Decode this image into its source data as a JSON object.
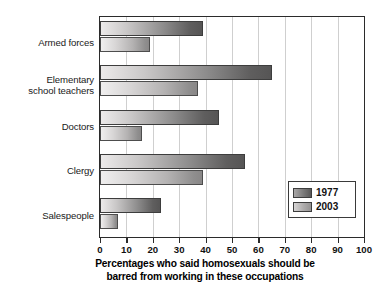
{
  "chart_data": {
    "type": "bar",
    "orientation": "horizontal",
    "title": "",
    "xlabel": "Percentages who said homosexuals should be barred from working in these occupations",
    "ylabel": "",
    "xlim": [
      0,
      100
    ],
    "xticks": [
      0,
      10,
      20,
      30,
      40,
      50,
      60,
      70,
      80,
      90,
      100
    ],
    "grid": true,
    "grid_axis": "x",
    "legend_position": "lower-right",
    "categories": [
      "Armed forces",
      "Elementary school teachers",
      "Doctors",
      "Clergy",
      "Salespeople"
    ],
    "series": [
      {
        "name": "1977",
        "color": "#6e6d6d",
        "values": [
          39,
          65,
          45,
          55,
          23
        ]
      },
      {
        "name": "2003",
        "color": "#a9a7a7",
        "values": [
          19,
          37,
          16,
          39,
          7
        ]
      }
    ]
  },
  "axis": {
    "tick_labels": [
      "0",
      "10",
      "20",
      "30",
      "40",
      "50",
      "60",
      "70",
      "80",
      "90",
      "100"
    ]
  },
  "categories": {
    "armed_forces": "Armed forces",
    "elementary_line1": "Elementary",
    "elementary_line2": "school teachers",
    "doctors": "Doctors",
    "clergy": "Clergy",
    "salespeople": "Salespeople"
  },
  "legend": {
    "entries": [
      {
        "label": "1977"
      },
      {
        "label": "2003"
      }
    ]
  },
  "caption": {
    "line1": "Percentages who said homosexuals should be",
    "line2": "barred from working in these occupations"
  }
}
